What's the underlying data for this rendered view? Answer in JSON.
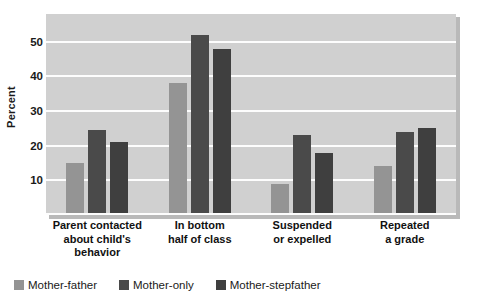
{
  "chart_data": {
    "type": "bar",
    "title": "",
    "xlabel": "",
    "ylabel": "Percent",
    "ylim": [
      0,
      58
    ],
    "yticks": [
      10,
      20,
      30,
      40,
      50
    ],
    "grid": true,
    "legend_position": "bottom-left",
    "categories": [
      "Parent contacted about child's behavior",
      "In bottom half of class",
      "Suspended or expelled",
      "Repeated a grade"
    ],
    "category_lines": [
      [
        "Parent contacted",
        "about child's",
        "behavior"
      ],
      [
        "In bottom",
        "half of class"
      ],
      [
        "Suspended",
        "or expelled"
      ],
      [
        "Repeated",
        "a grade"
      ]
    ],
    "series": [
      {
        "name": "Mother-father",
        "color": "#949494",
        "values": [
          15,
          38,
          9,
          14
        ]
      },
      {
        "name": "Mother-only",
        "color": "#4a4a4a",
        "values": [
          24.5,
          52,
          23,
          24
        ]
      },
      {
        "name": "Mother-stepfather",
        "color": "#3f3f3f",
        "values": [
          21,
          48,
          18,
          25
        ]
      }
    ]
  },
  "plot": {
    "background_color": "#d0d0d0",
    "gridline_color": "#fdfdfd"
  }
}
